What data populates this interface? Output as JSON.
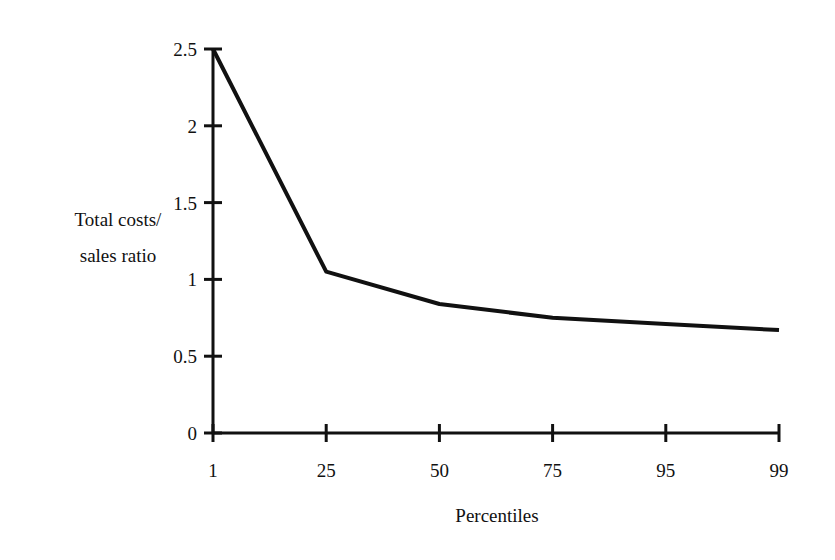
{
  "chart_data": {
    "type": "line",
    "title": "",
    "xlabel": "Percentiles",
    "ylabel": "Total costs/ sales ratio",
    "ylabel_lines": [
      "Total costs/",
      "sales ratio"
    ],
    "categories": [
      "1",
      "25",
      "50",
      "75",
      "95",
      "99"
    ],
    "values": [
      2.5,
      1.05,
      0.84,
      0.75,
      0.71,
      0.67
    ],
    "ylim": [
      0,
      2.5
    ],
    "yticks": [
      0,
      0.5,
      1,
      1.5,
      2,
      2.5
    ],
    "ytick_labels": [
      "0",
      "0.5",
      "1",
      "1.5",
      "2",
      "2.5"
    ],
    "grid": false,
    "legend": null,
    "line_color": "#111111"
  }
}
